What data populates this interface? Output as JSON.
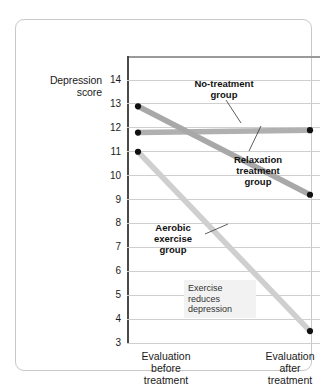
{
  "chart_data": {
    "type": "line",
    "title": "",
    "xlabel": "",
    "ylabel": "Depression score",
    "ylim": [
      3,
      14
    ],
    "yticks": [
      14,
      13,
      12,
      11,
      10,
      9,
      8,
      7,
      6,
      5,
      4,
      3
    ],
    "grid": true,
    "legend_position": "inline-annotations",
    "x": [
      "Evaluation before treatment",
      "Evaluation after treatment"
    ],
    "series": [
      {
        "name": "No-treatment group",
        "values": [
          11.8,
          11.9
        ],
        "color": "#b0b0b0",
        "label_text": "No-treatment\ngroup"
      },
      {
        "name": "Relaxation treatment group",
        "values": [
          12.9,
          9.2
        ],
        "color": "#a8a8a8",
        "label_text": "Relaxation\ntreatment\ngroup"
      },
      {
        "name": "Aerobic exercise group",
        "values": [
          11.0,
          3.5
        ],
        "color": "#cfcfcf",
        "label_text": "Aerobic\nexercise\ngroup"
      }
    ],
    "annotations": [
      {
        "text": "Exercise\nreduces\ndepression"
      }
    ],
    "marker_color": "#111111"
  },
  "axes": {
    "y_title": "Depression\nscore",
    "tick_labels": [
      "14",
      "13",
      "12",
      "11",
      "10",
      "9",
      "8",
      "7",
      "6",
      "5",
      "4",
      "3"
    ],
    "x_label_left": "Evaluation\nbefore\ntreatment",
    "x_label_right": "Evaluation\nafter\ntreatment"
  }
}
